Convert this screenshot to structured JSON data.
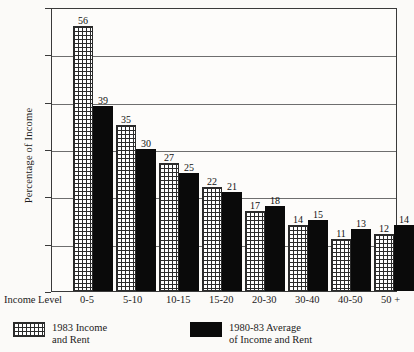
{
  "chart_data": {
    "type": "bar",
    "title": "",
    "xlabel": "Income Level",
    "ylabel": "Percentage of Income",
    "ylim": [
      0,
      60
    ],
    "ytick_labels": [
      "0",
      "10",
      "20",
      "30",
      "40",
      "50",
      "60"
    ],
    "grid": true,
    "legend_position": "below-axis",
    "categories": [
      "0-5",
      "5-10",
      "10-15",
      "15-20",
      "20-30",
      "30-40",
      "40-50",
      "50 +"
    ],
    "series": [
      {
        "name": "1983 Income and Rent",
        "name_line1": "1983 Income",
        "name_line2": "and Rent",
        "fill": "crosshatch",
        "color": "#ffffff",
        "values": [
          56,
          35,
          27,
          22,
          17,
          14,
          11,
          12
        ]
      },
      {
        "name": "1980-83 Average of Income and Rent",
        "name_line1": "1980-83 Average",
        "name_line2": "of Income and Rent",
        "fill": "solid",
        "color": "#0a0a0a",
        "values": [
          39,
          30,
          25,
          21,
          18,
          15,
          13,
          14
        ]
      }
    ]
  }
}
